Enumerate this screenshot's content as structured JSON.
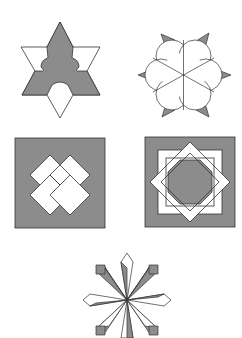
{
  "figure": {
    "width": 242,
    "height": 338,
    "panels": [
      {
        "id": "star-hexagram",
        "label": "six-pointed star with shaded Y-shaped center"
      },
      {
        "id": "flower-rosette",
        "label": "six-petal rosette with triangular tips"
      },
      {
        "id": "interlaced-squares",
        "label": "four interlocking squares on gray square"
      },
      {
        "id": "octagram-interlace",
        "label": "eight-pointed interlaced star on gray square"
      },
      {
        "id": "snowflake-crystals",
        "label": "eight-armed crystal snowflake"
      }
    ],
    "colors": {
      "fill_gray": "#8c8c8c",
      "fill_white": "#ffffff",
      "stroke": "#333333",
      "background": "#ffffff"
    }
  }
}
